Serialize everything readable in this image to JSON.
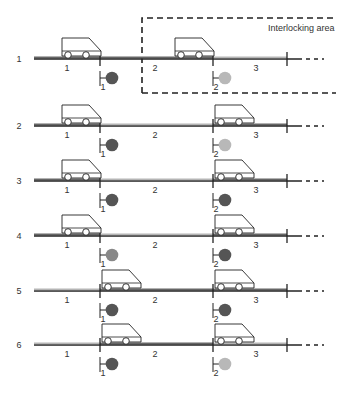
{
  "diagram": {
    "area_label": "Interlocking area",
    "colors": {
      "signal_red": "#555555",
      "signal_green": "#b8b8b8",
      "signal_amber": "#888888",
      "track_occupied": "#666666",
      "track_free": "#b5b5b5",
      "line": "#222222"
    },
    "section_labels": [
      "1",
      "2",
      "3"
    ],
    "signal_labels": [
      "1",
      "2"
    ],
    "rows": [
      {
        "label": "1",
        "y": 59,
        "signals": [
          "red",
          "green"
        ],
        "trains": [
          62,
          175
        ],
        "occupied": [
          1,
          2
        ]
      },
      {
        "label": "2",
        "y": 126,
        "signals": [
          "red",
          "green"
        ],
        "trains": [
          62,
          215
        ],
        "occupied": [
          1,
          3
        ]
      },
      {
        "label": "3",
        "y": 181,
        "signals": [
          "red",
          "red"
        ],
        "trains": [
          62,
          215
        ],
        "occupied": [
          1,
          3
        ]
      },
      {
        "label": "4",
        "y": 236,
        "signals": [
          "amber",
          "red"
        ],
        "trains": [
          62,
          215
        ],
        "occupied": [
          1,
          3
        ]
      },
      {
        "label": "5",
        "y": 291,
        "signals": [
          "red",
          "red"
        ],
        "trains": [
          102,
          215
        ],
        "occupied": [
          2,
          3
        ]
      },
      {
        "label": "6",
        "y": 345,
        "signals": [
          "red",
          "green"
        ],
        "trains": [
          102,
          215
        ],
        "occupied": [
          2
        ]
      }
    ]
  }
}
